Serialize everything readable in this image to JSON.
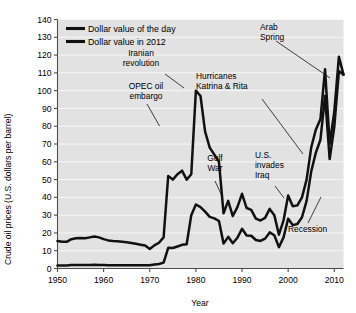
{
  "chart_data": {
    "type": "line",
    "title": "",
    "xlabel": "Year",
    "ylabel": "Crude oil prices (U.S. dollars per barrel)",
    "xlim": [
      1950,
      2012
    ],
    "ylim": [
      0,
      140
    ],
    "xticks": [
      1950,
      1960,
      1970,
      1980,
      1990,
      2000,
      2010
    ],
    "xtick_labels": [
      "1950",
      "1960",
      "1970",
      "1980",
      "1990",
      "2000",
      "2010"
    ],
    "yticks": [
      0,
      10,
      20,
      30,
      40,
      50,
      60,
      70,
      80,
      90,
      100,
      110,
      120,
      130,
      140
    ],
    "ytick_labels": [
      "0",
      "10",
      "20",
      "30",
      "40",
      "50",
      "60",
      "70",
      "80",
      "90",
      "100",
      "110",
      "120",
      "130",
      "140"
    ],
    "grid": true,
    "grid_color": "#f7f7f7",
    "plot_background": "#e2e2e2",
    "line_color": "#111111",
    "legend_position": "top-left-inside",
    "series": [
      {
        "name": "Dollar value of the day",
        "legend_label": "Dollar value of the day",
        "x": [
          1950,
          1951,
          1952,
          1953,
          1954,
          1955,
          1956,
          1957,
          1958,
          1959,
          1960,
          1961,
          1962,
          1963,
          1964,
          1965,
          1966,
          1967,
          1968,
          1969,
          1970,
          1971,
          1972,
          1973,
          1974,
          1975,
          1976,
          1977,
          1978,
          1979,
          1980,
          1981,
          1982,
          1983,
          1984,
          1985,
          1986,
          1987,
          1988,
          1989,
          1990,
          1991,
          1992,
          1993,
          1994,
          1995,
          1996,
          1997,
          1998,
          1999,
          2000,
          2001,
          2002,
          2003,
          2004,
          2005,
          2006,
          2007,
          2008,
          2009,
          2010,
          2011,
          2012
        ],
        "values": [
          1.7,
          1.7,
          1.7,
          1.9,
          1.9,
          1.9,
          1.9,
          2.0,
          2.1,
          2.0,
          1.9,
          1.8,
          1.8,
          1.8,
          1.8,
          1.8,
          1.8,
          1.8,
          1.8,
          1.8,
          1.8,
          2.2,
          2.5,
          3.3,
          11.6,
          11.5,
          12.4,
          13.3,
          13.6,
          30.0,
          36.0,
          34.5,
          32.0,
          29.0,
          28.2,
          26.7,
          14.0,
          17.8,
          14.2,
          17.3,
          22.3,
          18.6,
          18.4,
          16.0,
          15.5,
          16.8,
          20.3,
          18.7,
          12.0,
          17.5,
          28.0,
          24.4,
          25.0,
          28.8,
          38.0,
          54.5,
          65.1,
          72.4,
          97.0,
          61.5,
          79.5,
          111.0,
          109.0
        ],
        "description": "Nominal crude oil price in dollars of the day; near 2 dollars through 1950s-1960s, rises sharply after 1973, peaks near 36 in 1980, dips in late 1980s and 1990s, surges to about 97 in 2008, crashes to about 62 in 2009, then rises above 110 by 2011."
      },
      {
        "name": "Dollar value in 2012",
        "legend_label": "Dollar value in 2012",
        "x": [
          1950,
          1951,
          1952,
          1953,
          1954,
          1955,
          1956,
          1957,
          1958,
          1959,
          1960,
          1961,
          1962,
          1963,
          1964,
          1965,
          1966,
          1967,
          1968,
          1969,
          1970,
          1971,
          1972,
          1973,
          1974,
          1975,
          1976,
          1977,
          1978,
          1979,
          1980,
          1981,
          1982,
          1983,
          1984,
          1985,
          1986,
          1987,
          1988,
          1989,
          1990,
          1991,
          1992,
          1993,
          1994,
          1995,
          1996,
          1997,
          1998,
          1999,
          2000,
          2001,
          2002,
          2003,
          2004,
          2005,
          2006,
          2007,
          2008,
          2009,
          2010,
          2011,
          2012
        ],
        "values": [
          15.5,
          15.0,
          15.0,
          16.5,
          17.0,
          17.2,
          17.0,
          17.5,
          18.0,
          17.5,
          16.5,
          15.8,
          15.5,
          15.3,
          15.0,
          14.7,
          14.3,
          13.9,
          13.4,
          12.9,
          11.0,
          13.0,
          14.5,
          17.5,
          52.0,
          50.0,
          53.0,
          55.0,
          50.0,
          53.0,
          100.0,
          97.0,
          77.0,
          68.0,
          64.0,
          60.0,
          31.0,
          38.0,
          29.5,
          34.5,
          42.0,
          34.0,
          33.0,
          28.0,
          27.0,
          28.5,
          33.5,
          30.0,
          19.0,
          27.0,
          41.0,
          35.0,
          35.5,
          40.0,
          50.0,
          68.0,
          78.0,
          84.0,
          112.0,
          70.0,
          88.0,
          119.0,
          109.0
        ],
        "description": "Inflation-adjusted crude oil price in constant 2012 dollars; about 15 dollars in the 1950s, declining to about 11 by 1970, jumping after the 1973 OPEC embargo, peaking near 100 during the 1979-1980 Iranian revolution, falling through the 1980s-1990s to a low near 19 in 1998, then climbing to about 112 in 2008, collapsing to near 70 in 2009, and recovering above 115 by 2011."
      }
    ],
    "annotations": [
      {
        "id": "opec-oil-embargo",
        "text_lines": [
          "OPEC oil",
          "embargo"
        ],
        "points_to_year": 1974,
        "points_to_value": 52
      },
      {
        "id": "iranian-revolution",
        "text_lines": [
          "Iranian",
          "revolution"
        ],
        "points_to_year": 1980,
        "points_to_value": 100
      },
      {
        "id": "gulf-war",
        "text_lines": [
          "Gulf",
          "War"
        ],
        "points_to_year": 1990,
        "points_to_value": 42
      },
      {
        "id": "us-invades-iraq",
        "text_lines": [
          "U.S.",
          "invades",
          "Iraq"
        ],
        "points_to_year": 2003,
        "points_to_value": 40
      },
      {
        "id": "hurricanes-katrina-and-rita",
        "text_lines": [
          "Hurricanes",
          "Katrina & Rita"
        ],
        "points_to_year": 2005,
        "points_to_value": 68
      },
      {
        "id": "arab-spring",
        "text_lines": [
          "Arab",
          "Spring"
        ],
        "points_to_year": 2011,
        "points_to_value": 119
      },
      {
        "id": "recession",
        "text_lines": [
          "Recession"
        ],
        "points_to_year": 2009,
        "points_to_value": 70
      }
    ]
  },
  "legend": {
    "items": [
      {
        "label": "Dollar value of the day"
      },
      {
        "label": "Dollar value in 2012"
      }
    ]
  },
  "axes": {
    "y_title": "Crude oil prices (U.S. dollars per barrel)",
    "x_title": "Year"
  },
  "annotation_labels": {
    "opec_line1": "OPEC oil",
    "opec_line2": "embargo",
    "iran_line1": "Iranian",
    "iran_line2": "revolution",
    "gulf_line1": "Gulf",
    "gulf_line2": "War",
    "iraq_line1": "U.S.",
    "iraq_line2": "invades",
    "iraq_line3": "Iraq",
    "hurricane_line1": "Hurricanes",
    "hurricane_line2": "Katrina & Rita",
    "arab_line1": "Arab",
    "arab_line2": "Spring",
    "recession_line1": "Recession"
  }
}
